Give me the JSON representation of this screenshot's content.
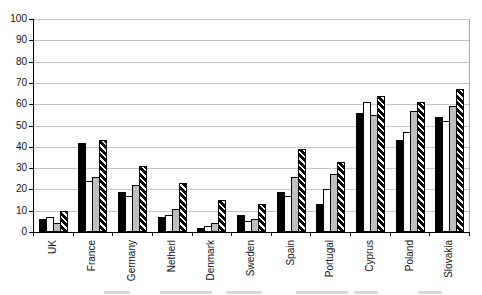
{
  "chart_data": {
    "type": "bar",
    "title": "",
    "xlabel": "",
    "ylabel": "",
    "ylim": [
      0,
      100
    ],
    "ytick_step": 10,
    "yticks": [
      0,
      10,
      20,
      30,
      40,
      50,
      60,
      70,
      80,
      90,
      100
    ],
    "grid": true,
    "legend": "none",
    "categories": [
      "UK",
      "France",
      "Germany",
      "Netherl",
      "Denmark",
      "Sweden",
      "Spain",
      "Portugal",
      "Cyprus",
      "Poland",
      "Slovakia"
    ],
    "series": [
      {
        "name": "series-1-black",
        "style": "black",
        "values": [
          6,
          42,
          19,
          7,
          2,
          8,
          19,
          13,
          56,
          43,
          54
        ]
      },
      {
        "name": "series-2-white",
        "style": "white",
        "values": [
          7,
          24,
          17,
          8,
          3,
          5,
          17,
          20,
          61,
          47,
          52
        ]
      },
      {
        "name": "series-3-gray",
        "style": "gray",
        "values": [
          4,
          26,
          22,
          11,
          4,
          6,
          26,
          27,
          55,
          57,
          59
        ]
      },
      {
        "name": "series-4-hatched",
        "style": "hatched",
        "values": [
          10,
          43,
          31,
          23,
          15,
          13,
          39,
          33,
          64,
          61,
          67
        ]
      }
    ],
    "colors": {
      "bar_black": "#000000",
      "bar_white": "#ffffff",
      "bar_gray": "#bfbfbf",
      "hatch_foreground": "#000000",
      "gridline": "#c6c6c6",
      "axis": "#000000",
      "background": "#ffffff"
    }
  },
  "clipped_caption_segments": [
    {
      "x": 104,
      "w": 26
    },
    {
      "x": 160,
      "w": 52
    },
    {
      "x": 226,
      "w": 36
    },
    {
      "x": 296,
      "w": 52
    },
    {
      "x": 354,
      "w": 24
    },
    {
      "x": 418,
      "w": 24
    }
  ]
}
